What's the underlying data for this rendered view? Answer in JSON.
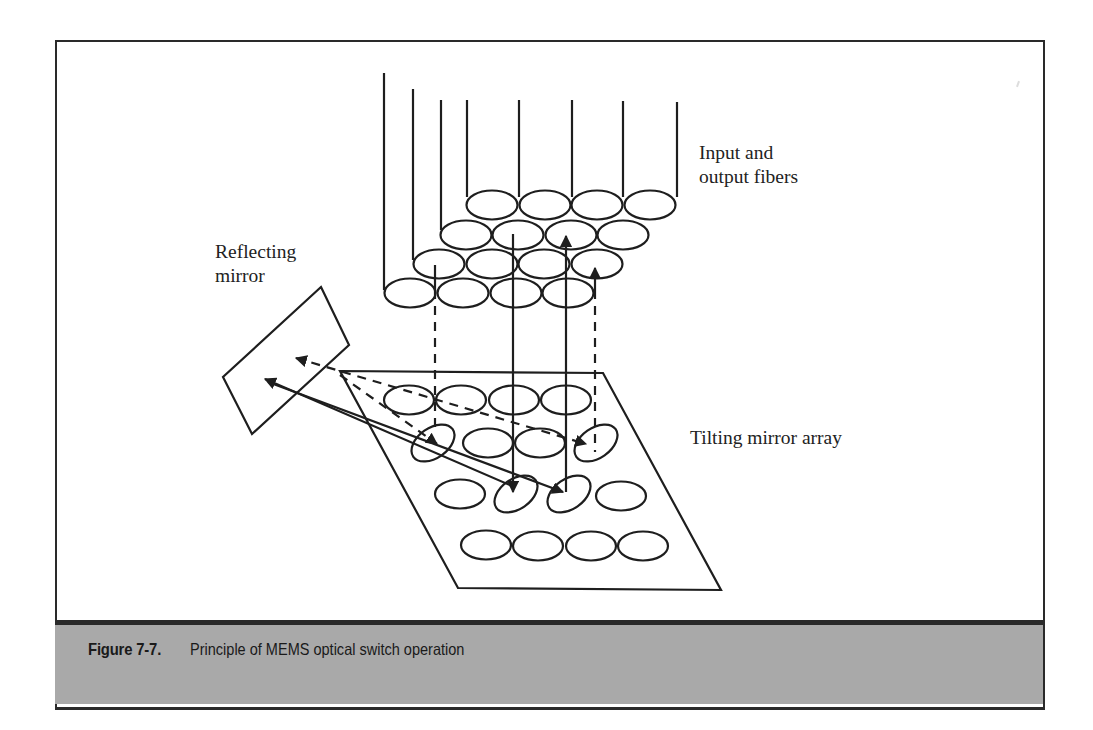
{
  "figure": {
    "number": "Figure 7-7.",
    "caption": "Principle of MEMS optical switch operation",
    "colors": {
      "line": "#222222",
      "caption_bar": "#a9a9a9",
      "border": "#2a2a2a",
      "background": "#ffffff"
    }
  },
  "labels": {
    "fibers": [
      "Input and",
      "output fibers"
    ],
    "mirror": [
      "Reflecting",
      "mirror"
    ],
    "array": "Tilting mirror array"
  },
  "diagram": {
    "components": [
      {
        "name": "input-output-fiber-bundle",
        "rows": 4,
        "cols": 4,
        "fiber_leads": 8
      },
      {
        "name": "reflecting-mirror",
        "shape": "tilted-rectangle"
      },
      {
        "name": "tilting-mirror-array",
        "rows": 4,
        "cols": 4,
        "tilted_mirrors": 4
      }
    ],
    "beam_paths": [
      {
        "style": "dashed",
        "description": "fiber -> tilting mirror -> reflecting mirror -> tilting mirror -> fiber"
      },
      {
        "style": "solid",
        "description": "fiber -> tilting mirror -> reflecting mirror -> tilting mirror -> fiber"
      }
    ]
  }
}
